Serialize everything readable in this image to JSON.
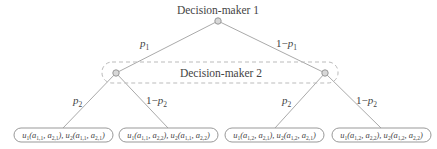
{
  "diagram": {
    "type": "game-tree",
    "root": {
      "label": "Decision-maker 1"
    },
    "information_set": {
      "label": "Decision-maker 2",
      "style": "dashed"
    },
    "level1_branches": [
      {
        "prob": "p",
        "prob_sub": "1",
        "prefix": ""
      },
      {
        "prob": "p",
        "prob_sub": "1",
        "prefix": "1−"
      }
    ],
    "level2_branches": [
      {
        "prob": "p",
        "prob_sub": "2",
        "prefix": ""
      },
      {
        "prob": "p",
        "prob_sub": "2",
        "prefix": "1−"
      },
      {
        "prob": "p",
        "prob_sub": "2",
        "prefix": ""
      },
      {
        "prob": "p",
        "prob_sub": "2",
        "prefix": "1−"
      }
    ],
    "leaves": [
      {
        "i": "1",
        "j": "1",
        "text": "u1(a1,1, a2,1), u2(a1,1, a2,1)"
      },
      {
        "i": "1",
        "j": "2",
        "text": "u1(a1,1, a2,2), u2(a1,1, a2,2)"
      },
      {
        "i": "2",
        "j": "1",
        "text": "u1(a1,2, a2,1), u2(a1,2, a2,1)"
      },
      {
        "i": "2",
        "j": "2",
        "text": "u1(a1,2, a2,2), u2(a1,2, a2,2)"
      }
    ],
    "colors": {
      "edge": "#aaaaaa",
      "node_fill": "#d8d8d8",
      "text": "#444444"
    }
  }
}
